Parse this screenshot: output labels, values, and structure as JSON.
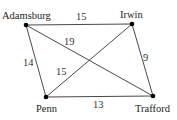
{
  "diagram": {
    "type": "weighted-graph",
    "nodes": [
      {
        "id": "adamsburg",
        "label": "Adamsburg",
        "x": 26,
        "y": 25
      },
      {
        "id": "irwin",
        "label": "Irwin",
        "x": 132,
        "y": 24
      },
      {
        "id": "penn",
        "label": "Penn",
        "x": 46,
        "y": 97
      },
      {
        "id": "trafford",
        "label": "Trafford",
        "x": 153,
        "y": 96
      }
    ],
    "edges": [
      {
        "from": "adamsburg",
        "to": "irwin",
        "weight": "15"
      },
      {
        "from": "adamsburg",
        "to": "trafford",
        "weight": "19"
      },
      {
        "from": "adamsburg",
        "to": "penn",
        "weight": "14"
      },
      {
        "from": "irwin",
        "to": "penn",
        "weight": "15"
      },
      {
        "from": "irwin",
        "to": "trafford",
        "weight": "9"
      },
      {
        "from": "penn",
        "to": "trafford",
        "weight": "13"
      }
    ]
  }
}
